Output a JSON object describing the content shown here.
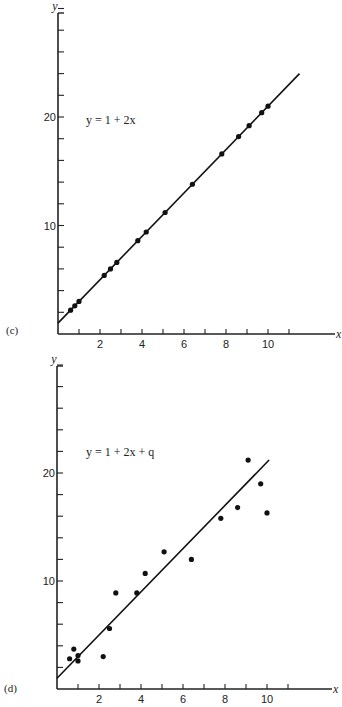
{
  "chart_data": [
    {
      "type": "scatter",
      "panel_label": "(c)",
      "title": "",
      "annotation": "y = 1 + 2x",
      "xlabel": "x",
      "ylabel": "y",
      "xlim": [
        0,
        13
      ],
      "ylim": [
        0,
        30
      ],
      "x_ticks": [
        1,
        2,
        3,
        4,
        5,
        6,
        7,
        8,
        9,
        10,
        11
      ],
      "x_tick_labels": [
        "2",
        "4",
        "6",
        "8",
        "10"
      ],
      "x_labeled": [
        2,
        4,
        6,
        8,
        10
      ],
      "y_ticks": [
        2,
        4,
        6,
        8,
        10,
        12,
        14,
        16,
        18,
        20,
        22,
        24,
        26,
        28,
        30
      ],
      "y_tick_labels": [
        "10",
        "20"
      ],
      "y_labeled": [
        10,
        20
      ],
      "grid": false,
      "line": {
        "x": [
          0,
          11.5
        ],
        "y": [
          1,
          24
        ]
      },
      "x": [
        0.6,
        0.8,
        1.0,
        2.2,
        2.5,
        2.8,
        3.8,
        4.2,
        5.1,
        6.4,
        7.8,
        8.6,
        9.1,
        9.7,
        10.0
      ],
      "y": [
        2.2,
        2.6,
        3.0,
        5.4,
        6.0,
        6.6,
        8.6,
        9.4,
        11.2,
        13.8,
        16.6,
        18.2,
        19.2,
        20.4,
        21.0
      ]
    },
    {
      "type": "scatter",
      "panel_label": "(d)",
      "title": "",
      "annotation": "y = 1 + 2x + q",
      "xlabel": "x",
      "ylabel": "y",
      "xlim": [
        0,
        13
      ],
      "ylim": [
        0,
        30
      ],
      "x_ticks": [
        1,
        2,
        3,
        4,
        5,
        6,
        7,
        8,
        9,
        10,
        11
      ],
      "x_tick_labels": [
        "2",
        "4",
        "6",
        "8",
        "10"
      ],
      "x_labeled": [
        2,
        4,
        6,
        8,
        10
      ],
      "y_ticks": [
        2,
        4,
        6,
        8,
        10,
        12,
        14,
        16,
        18,
        20,
        22,
        24,
        26,
        28,
        30
      ],
      "y_tick_labels": [
        "10",
        "20"
      ],
      "y_labeled": [
        10,
        20
      ],
      "grid": false,
      "line": {
        "x": [
          0,
          10.1
        ],
        "y": [
          1,
          21.2
        ]
      },
      "x": [
        0.6,
        0.8,
        1.0,
        1.0,
        2.2,
        2.5,
        2.8,
        3.8,
        4.2,
        5.1,
        6.4,
        7.8,
        8.6,
        9.1,
        9.7,
        10.0
      ],
      "y": [
        2.8,
        3.7,
        3.1,
        2.6,
        3.0,
        5.6,
        8.9,
        8.9,
        10.7,
        12.7,
        12.0,
        15.8,
        16.8,
        21.2,
        19.0,
        16.3
      ]
    }
  ]
}
